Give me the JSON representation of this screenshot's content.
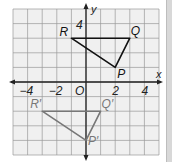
{
  "diagram": {
    "type": "coordinate-plane-translation",
    "grid": {
      "x_range": [
        -5,
        5
      ],
      "y_range": [
        -5,
        5
      ],
      "step": 1,
      "background": "#f0f0f0",
      "grid_color": "#9a9a9a"
    },
    "axes": {
      "x_label": "x",
      "y_label": "y",
      "origin_label": "O",
      "x_ticks": [
        {
          "value": -4,
          "label": "−4"
        },
        {
          "value": -2,
          "label": "−2"
        },
        {
          "value": 2,
          "label": "2"
        },
        {
          "value": 4,
          "label": "4"
        }
      ],
      "y_ticks": [
        {
          "value": 4,
          "label": "4"
        }
      ],
      "color": "#222222"
    },
    "preimage": {
      "name": "triangle PQR",
      "color": "#111111",
      "vertices": [
        {
          "label": "P",
          "x": 2,
          "y": 1
        },
        {
          "label": "Q",
          "x": 3,
          "y": 3
        },
        {
          "label": "R",
          "x": -1,
          "y": 3
        }
      ]
    },
    "image": {
      "name": "triangle P'Q'R'",
      "color": "#777777",
      "vertices": [
        {
          "label": "P′",
          "x": 0,
          "y": -4
        },
        {
          "label": "Q′",
          "x": 1,
          "y": -2
        },
        {
          "label": "R′",
          "x": -3,
          "y": -2
        }
      ]
    }
  }
}
